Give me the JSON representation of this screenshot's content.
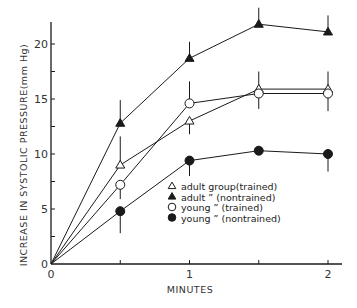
{
  "chart_data": {
    "type": "line",
    "title": "",
    "xlabel": "MINUTES",
    "ylabel": "INCREASE IN SYSTOLIC PRESSURE(mm Hg)",
    "xlim": [
      0,
      2.1
    ],
    "ylim": [
      0,
      22.5
    ],
    "x_ticks": [
      0,
      0.5,
      1,
      1.5,
      2
    ],
    "x_tick_labels": [
      "0",
      "",
      "1",
      "",
      "2"
    ],
    "y_ticks": [
      0,
      2.5,
      5,
      7.5,
      10,
      12.5,
      15,
      17.5,
      20
    ],
    "y_tick_labels": [
      "0",
      "",
      "5",
      "",
      "10",
      "",
      "15",
      "",
      "20"
    ],
    "grid": false,
    "legend_position": "inside lower right",
    "x": [
      0,
      0.5,
      1,
      1.5,
      2
    ],
    "series": [
      {
        "name": "adult group(trained)",
        "legend_label": "adult group(trained)",
        "marker": "open-triangle",
        "values": [
          0,
          9,
          13,
          15.9,
          15.9
        ],
        "error_up": [
          0,
          2.6,
          0,
          1.6,
          1.6
        ],
        "error_down": [
          0,
          0,
          1.2,
          0,
          0
        ]
      },
      {
        "name": "adult (nontrained)",
        "legend_label": "adult  ”   (nontrained)",
        "marker": "filled-triangle",
        "values": [
          0,
          12.8,
          18.7,
          21.8,
          21.1
        ],
        "error_up": [
          0,
          2.1,
          1.5,
          1.5,
          1.5
        ],
        "error_down": [
          0,
          0,
          0,
          0,
          0
        ]
      },
      {
        "name": "young (trained)",
        "legend_label": "young  ”   (trained)",
        "marker": "open-circle",
        "values": [
          0,
          7.2,
          14.6,
          15.5,
          15.5
        ],
        "error_up": [
          0,
          0,
          2,
          0,
          0
        ],
        "error_down": [
          0,
          1.3,
          0,
          1.4,
          1.6
        ]
      },
      {
        "name": "young (nontrained)",
        "legend_label": "young  ”   (nontrained)",
        "marker": "filled-circle",
        "values": [
          0,
          4.8,
          9.4,
          10.3,
          10.0
        ],
        "error_up": [
          0,
          0,
          0,
          0,
          0
        ],
        "error_down": [
          0,
          2,
          1.4,
          0,
          1.6
        ]
      }
    ]
  },
  "colors": {
    "ink": "#1a1a1a",
    "background": "#ffffff"
  }
}
